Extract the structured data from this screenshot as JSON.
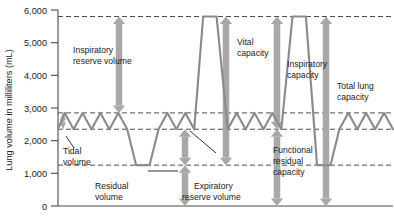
{
  "chart_data": {
    "type": "line",
    "title": "",
    "xlabel": "",
    "ylabel": "Lung volume in milliliters (mL)",
    "ylim": [
      0,
      6000
    ],
    "yticks": [
      0,
      1000,
      2000,
      3000,
      4000,
      5000,
      6000
    ],
    "ytick_labels": [
      "0",
      "1,000",
      "2,000",
      "3,000",
      "4,000",
      "5,000",
      "6,000"
    ],
    "grid": false,
    "axis_color": "#4a4a4a",
    "trace_color": "#8a8a8a",
    "arrow_color": "#a8a8a8",
    "dash_color": "#3a3a3a",
    "reference_levels": [
      {
        "name": "total-lung-capacity-level",
        "value": 5800,
        "label": ""
      },
      {
        "name": "tidal-peak-level",
        "value": 2850,
        "label": ""
      },
      {
        "name": "tidal-trough-level",
        "value": 2350,
        "label": ""
      },
      {
        "name": "residual-volume-level",
        "value": 1250,
        "label": ""
      }
    ],
    "series": [
      {
        "name": "Spirogram trace",
        "points": [
          [
            0.0,
            2350
          ],
          [
            0.6,
            2850
          ],
          [
            1.4,
            2350
          ],
          [
            2.2,
            2850
          ],
          [
            3.0,
            2350
          ],
          [
            3.8,
            2850
          ],
          [
            4.6,
            2350
          ],
          [
            5.4,
            2850
          ],
          [
            6.2,
            2350
          ],
          [
            7.0,
            1250
          ],
          [
            8.2,
            1250
          ],
          [
            9.0,
            2350
          ],
          [
            9.8,
            2850
          ],
          [
            10.6,
            2350
          ],
          [
            11.4,
            2850
          ],
          [
            12.2,
            2350
          ],
          [
            13.0,
            5800
          ],
          [
            14.2,
            5800
          ],
          [
            15.2,
            2350
          ],
          [
            16.0,
            2850
          ],
          [
            16.8,
            2350
          ],
          [
            17.6,
            2850
          ],
          [
            18.4,
            2350
          ],
          [
            19.2,
            2850
          ],
          [
            20.0,
            2350
          ],
          [
            21.0,
            5800
          ],
          [
            22.2,
            5800
          ],
          [
            23.2,
            1250
          ],
          [
            24.4,
            1250
          ],
          [
            25.2,
            2350
          ],
          [
            26.0,
            2850
          ],
          [
            26.8,
            2350
          ],
          [
            27.6,
            2850
          ],
          [
            28.4,
            2350
          ],
          [
            29.2,
            2850
          ],
          [
            30.0,
            2350
          ]
        ]
      }
    ],
    "volumes": [
      {
        "key": "inspiratory-reserve-volume",
        "label_line1": "Inspiratory",
        "label_line2": "reserve volume",
        "from": 2850,
        "to": 5800,
        "direction": "double"
      },
      {
        "key": "tidal-volume",
        "label_line1": "Tidal",
        "label_line2": "volume",
        "from": 2350,
        "to": 2850,
        "direction": "double"
      },
      {
        "key": "expiratory-reserve-volume",
        "label_line1": "Expiratory",
        "label_line2": "reserve volume",
        "from": 1250,
        "to": 2350,
        "direction": "double"
      },
      {
        "key": "residual-volume",
        "label_line1": "Residual",
        "label_line2": "volume",
        "from": 0,
        "to": 1250,
        "direction": "double"
      }
    ],
    "capacities": [
      {
        "key": "vital-capacity",
        "label_line1": "Vital",
        "label_line2": "capacity",
        "from": 1250,
        "to": 5800,
        "direction": "double"
      },
      {
        "key": "inspiratory-capacity",
        "label_line1": "Inspiratory",
        "label_line2": "capacity",
        "from": 2350,
        "to": 5800,
        "direction": "double"
      },
      {
        "key": "functional-residual-capacity",
        "label_line1": "Functional",
        "label_line2": "residual",
        "label_line3": "capacity",
        "from": 0,
        "to": 2350,
        "direction": "double"
      },
      {
        "key": "total-lung-capacity",
        "label_line1": "Total lung",
        "label_line2": "capacity",
        "from": 0,
        "to": 5800,
        "direction": "double"
      }
    ]
  },
  "axis": {
    "y_title": "Lung volume in milliliters (mL)",
    "t6000": "6,000",
    "t5000": "5,000",
    "t4000": "4,000",
    "t3000": "3,000",
    "t2000": "2,000",
    "t1000": "1,000",
    "t0": "0"
  },
  "labels": {
    "irv_l1": "Inspiratory",
    "irv_l2": "reserve volume",
    "tidal_l1": "Tidal",
    "tidal_l2": "volume",
    "residual_l1": "Residual",
    "residual_l2": "volume",
    "erv_l1": "Expiratory",
    "erv_l2": "reserve volume",
    "vital_l1": "Vital",
    "vital_l2": "capacity",
    "inspcap_l1": "Inspiratory",
    "inspcap_l2": "capacity",
    "frc_l1": "Functional",
    "frc_l2": "residual",
    "frc_l3": "capacity",
    "tlc_l1": "Total lung",
    "tlc_l2": "capacity"
  }
}
